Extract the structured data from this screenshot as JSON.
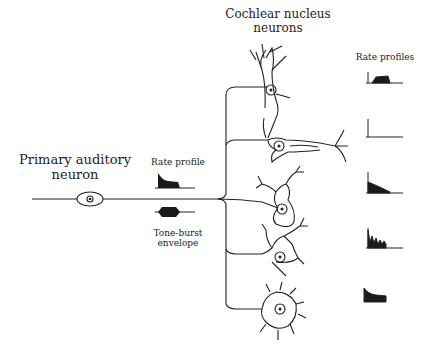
{
  "labels": {
    "primary_title_1": "Primary auditory",
    "primary_title_2": "neuron",
    "rate_profile": "Rate profile",
    "tone_burst_1": "Tone-burst",
    "tone_burst_2": "envelope",
    "cochlear_title_1": "Cochlear nucleus",
    "cochlear_title_2": "neurons",
    "rate_profiles": "Rate profiles"
  },
  "neurons": [
    {
      "type": "pyramidal",
      "profile": "buildup"
    },
    {
      "type": "octopus",
      "profile": "onset"
    },
    {
      "type": "stellate-1",
      "profile": "primary-notch"
    },
    {
      "type": "stellate-2",
      "profile": "chopper"
    },
    {
      "type": "bushy",
      "profile": "primary-like"
    }
  ],
  "colors": {
    "ink": "#222222",
    "fill": "#1a1a1a"
  }
}
